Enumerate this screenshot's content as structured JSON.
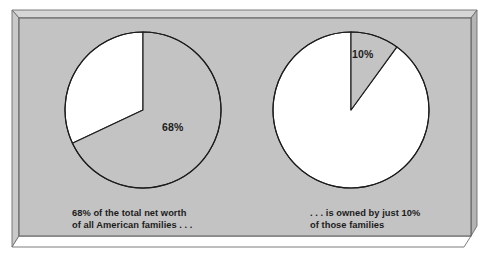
{
  "figure": {
    "kind": "two-pie-comparison-figure",
    "background_color": "#ffffff",
    "panel_color": "#c3c3c3",
    "bevel_light_color": "#dedede",
    "bevel_dark_color": "#9a9a9a",
    "outline_color": "#1c1c1c"
  },
  "charts": [
    {
      "id": "left-pie",
      "value_label": "68%",
      "caption_line1": "68% of the total net worth",
      "caption_line2": "of all American families . . ."
    },
    {
      "id": "right-pie",
      "value_label": "10%",
      "caption_line1": ". . . is owned by just 10%",
      "caption_line2": "of those families"
    }
  ],
  "chart_data": [
    {
      "type": "pie",
      "id": "left-pie",
      "title": "68% of the total net worth of all American families . . .",
      "categories": [
        "Share of total net worth",
        "Remainder"
      ],
      "values": [
        68,
        32
      ],
      "labels": [
        "68%",
        ""
      ],
      "colors": [
        "#c3c3c3",
        "#ffffff"
      ],
      "start_angle_deg": 0,
      "direction": "clockwise",
      "legend": "none",
      "grid": false,
      "annotations": [
        "68%"
      ]
    },
    {
      "type": "pie",
      "id": "right-pie",
      "title": ". . . is owned by just 10% of those families",
      "categories": [
        "Share of families owning it",
        "Remainder"
      ],
      "values": [
        10,
        90
      ],
      "labels": [
        "10%",
        ""
      ],
      "colors": [
        "#c3c3c3",
        "#ffffff"
      ],
      "start_angle_deg": 0,
      "direction": "clockwise",
      "legend": "none",
      "grid": false,
      "annotations": [
        "10%"
      ]
    }
  ]
}
